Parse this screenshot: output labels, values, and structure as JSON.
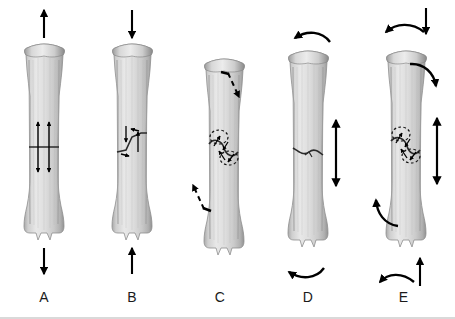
{
  "figure": {
    "background": "#ffffff",
    "width": 455,
    "height": 319,
    "bone_color_light": "#e4e4e4",
    "bone_color_mid": "#c9c9c9",
    "bone_color_dark": "#9a9a9a",
    "arrow_color": "#000000",
    "baseline_color": "#d9d9d9"
  },
  "panels": [
    {
      "id": "A",
      "label": "A",
      "center_x": 40,
      "force": "tension / distraction",
      "fracture_type": "transverse",
      "top_arrow": "straight-up-arrow",
      "bottom_arrow": "straight-down-arrow",
      "internal_arrows": "two vertical double-headed arrows spanning the fracture",
      "dashed": false
    },
    {
      "id": "B",
      "label": "B",
      "center_x": 130,
      "force": "compression / shear",
      "fracture_type": "oblique",
      "top_arrow": "straight-down-arrow",
      "bottom_arrow": "straight-up-arrow",
      "internal_arrows": "small opposing shear arrows along the oblique line",
      "dashed": false
    },
    {
      "id": "C",
      "label": "C",
      "center_x": 218,
      "force": "torsion / rotation",
      "fracture_type": "spiral",
      "top_arrow": "dashed-diagonal-down-right-arrow",
      "bottom_arrow": "dashed-diagonal-up-left-arrow",
      "internal_arrows": "dashed elliptical rotation arrows encircling the shaft",
      "dashed": true
    },
    {
      "id": "D",
      "label": "D",
      "center_x": 307,
      "force": "bending",
      "fracture_type": "butterfly / wedge",
      "top_arrow": "curved-left-arrow",
      "bottom_arrow": "curved-left-arrow",
      "internal_arrows": "large vertical double-headed arrow beside the fracture",
      "dashed": false
    },
    {
      "id": "E",
      "label": "E",
      "center_x": 405,
      "force": "combined bending and torsion",
      "fracture_type": "spiral with butterfly",
      "top_arrow": "curved-left-arrow plus straight-down-arrow",
      "bottom_arrow": "curved-left-arrow plus straight-up-arrow",
      "internal_arrows": "dashed rotation arrows plus large vertical double-headed arrow",
      "dashed": true
    }
  ]
}
